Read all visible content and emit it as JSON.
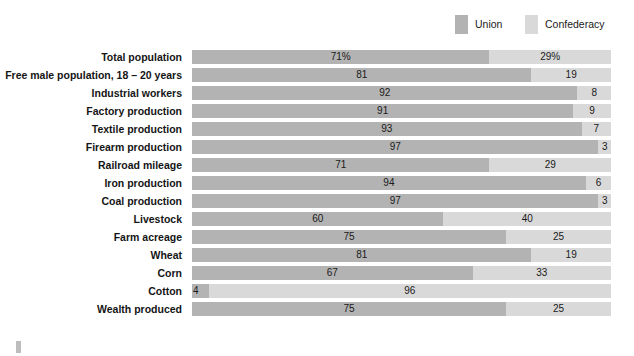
{
  "legend": {
    "position": "top-right",
    "items": [
      {
        "label": "Union",
        "color": "#b3b3b3",
        "icon": "legend-swatch-icon"
      },
      {
        "label": "Confederacy",
        "color": "#d9d9d9",
        "icon": "legend-swatch-icon"
      }
    ]
  },
  "chart_data": {
    "type": "bar",
    "orientation": "horizontal",
    "stacked": true,
    "stacked_total": 100,
    "title": "",
    "subtitle": "",
    "xlabel": "",
    "ylabel": "",
    "xlim": [
      0,
      100
    ],
    "grid": false,
    "legend_position": "top-right",
    "categories": [
      "Total population",
      "Free male population, 18 – 20 years",
      "Industrial workers",
      "Factory production",
      "Textile production",
      "Firearm production",
      "Railroad mileage",
      "Iron production",
      "Coal production",
      "Livestock",
      "Farm acreage",
      "Wheat",
      "Corn",
      "Cotton",
      "Wealth produced"
    ],
    "series": [
      {
        "name": "Union",
        "color": "#b3b3b3",
        "values": [
          71,
          81,
          92,
          91,
          93,
          97,
          71,
          94,
          97,
          60,
          75,
          81,
          67,
          4,
          75
        ],
        "labels": [
          "71%",
          "81",
          "92",
          "91",
          "93",
          "97",
          "71",
          "94",
          "97",
          "60",
          "75",
          "81",
          "67",
          "4",
          "75"
        ]
      },
      {
        "name": "Confederacy",
        "color": "#d9d9d9",
        "values": [
          29,
          19,
          8,
          9,
          7,
          3,
          29,
          6,
          3,
          40,
          25,
          19,
          33,
          96,
          25
        ],
        "labels": [
          "29%",
          "19",
          "8",
          "9",
          "7",
          "3",
          "29",
          "6",
          "3",
          "40",
          "25",
          "19",
          "33",
          "96",
          "25"
        ]
      }
    ]
  }
}
